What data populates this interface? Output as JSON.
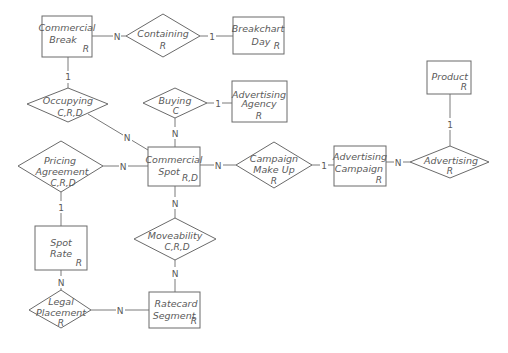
{
  "diagram": {
    "type": "entity-relationship",
    "entities": [
      {
        "id": "commercial_break",
        "lines": [
          "Commercial",
          "Break"
        ],
        "ops": "R"
      },
      {
        "id": "breakchart_day",
        "lines": [
          "Breakchart",
          "Day"
        ],
        "ops": "R"
      },
      {
        "id": "advertising_agency",
        "lines": [
          "Advertising",
          "Agency"
        ],
        "ops": "R"
      },
      {
        "id": "product",
        "lines": [
          "Product"
        ],
        "ops": "R"
      },
      {
        "id": "commercial_spot",
        "lines": [
          "Commercial",
          "Spot"
        ],
        "ops": "R,D"
      },
      {
        "id": "advertising_campaign",
        "lines": [
          "Advertising",
          "Campaign"
        ],
        "ops": "R"
      },
      {
        "id": "spot_rate",
        "lines": [
          "Spot",
          "Rate"
        ],
        "ops": "R"
      },
      {
        "id": "ratecard_segment",
        "lines": [
          "Ratecard",
          "Segment"
        ],
        "ops": "R"
      }
    ],
    "relationships": [
      {
        "id": "containing",
        "lines": [
          "Containing"
        ],
        "ops": "R"
      },
      {
        "id": "occupying",
        "lines": [
          "Occupying"
        ],
        "ops": "C,R,D"
      },
      {
        "id": "buying",
        "lines": [
          "Buying"
        ],
        "ops": "C"
      },
      {
        "id": "pricing_agreement",
        "lines": [
          "Pricing",
          "Agreement"
        ],
        "ops": "C,R,D"
      },
      {
        "id": "campaign_make_up",
        "lines": [
          "Campaign",
          "Make Up"
        ],
        "ops": "R"
      },
      {
        "id": "advertising",
        "lines": [
          "Advertising"
        ],
        "ops": "R"
      },
      {
        "id": "moveability",
        "lines": [
          "Moveability"
        ],
        "ops": "C,R,D"
      },
      {
        "id": "legal_placement",
        "lines": [
          "Legal",
          "Placement"
        ],
        "ops": "R"
      }
    ],
    "connections": [
      {
        "from": "commercial_break",
        "to": "containing",
        "cardinality": "N"
      },
      {
        "from": "containing",
        "to": "breakchart_day",
        "cardinality": "1"
      },
      {
        "from": "commercial_break",
        "to": "occupying",
        "cardinality": "1"
      },
      {
        "from": "occupying",
        "to": "commercial_spot",
        "cardinality": "N"
      },
      {
        "from": "buying",
        "to": "advertising_agency",
        "cardinality": "1"
      },
      {
        "from": "buying",
        "to": "commercial_spot",
        "cardinality": "N"
      },
      {
        "from": "pricing_agreement",
        "to": "commercial_spot",
        "cardinality": "N"
      },
      {
        "from": "commercial_spot",
        "to": "campaign_make_up",
        "cardinality": "N"
      },
      {
        "from": "campaign_make_up",
        "to": "advertising_campaign",
        "cardinality": "1"
      },
      {
        "from": "advertising_campaign",
        "to": "advertising",
        "cardinality": "N"
      },
      {
        "from": "product",
        "to": "advertising",
        "cardinality": "1"
      },
      {
        "from": "pricing_agreement",
        "to": "spot_rate",
        "cardinality": "1"
      },
      {
        "from": "commercial_spot",
        "to": "moveability",
        "cardinality": "N"
      },
      {
        "from": "moveability",
        "to": "ratecard_segment",
        "cardinality": "N"
      },
      {
        "from": "spot_rate",
        "to": "legal_placement",
        "cardinality": "N"
      },
      {
        "from": "legal_placement",
        "to": "ratecard_segment",
        "cardinality": "N"
      }
    ]
  }
}
